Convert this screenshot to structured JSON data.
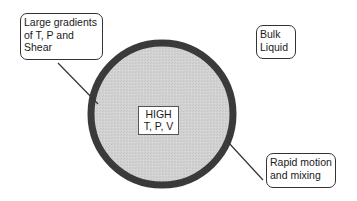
{
  "diagram": {
    "center_label": [
      "HIGH",
      "T, P, V"
    ],
    "callouts": {
      "top_left": [
        "Large gradients",
        "of T, P and",
        "Shear"
      ],
      "top_right": [
        "Bulk",
        "Liquid"
      ],
      "bottom_right": [
        "Rapid motion",
        "and mixing"
      ]
    },
    "colors": {
      "bubble_fill": "#cfcfcf",
      "bubble_border": "#3a3a3a",
      "line": "#333333"
    }
  }
}
